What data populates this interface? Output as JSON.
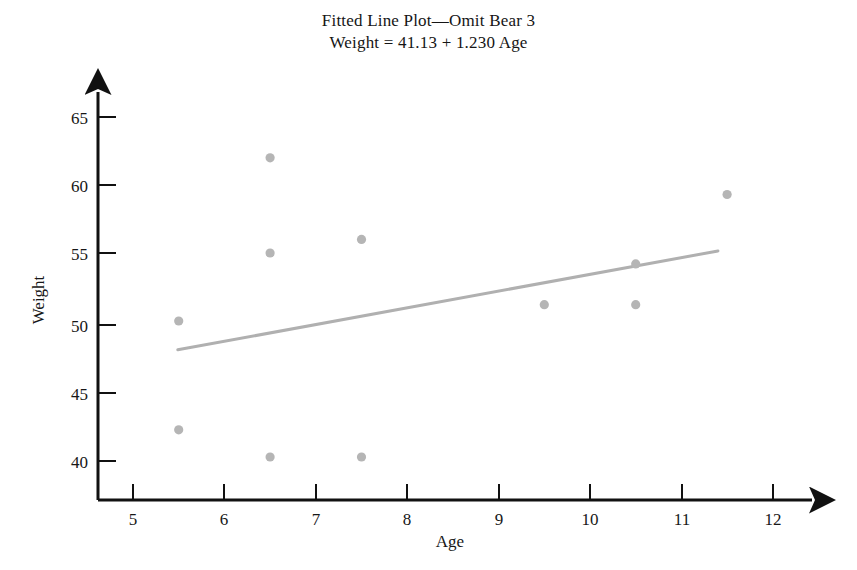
{
  "chart_data": {
    "type": "scatter",
    "title": "Fitted Line Plot—Omit Bear 3",
    "subtitle": "Weight = 41.13 + 1.230 Age",
    "xlabel": "Age",
    "ylabel": "Weight",
    "xlim": [
      4.6,
      12.4
    ],
    "ylim": [
      38.0,
      66.4
    ],
    "xticks": [
      5,
      6,
      7,
      8,
      9,
      10,
      11,
      12
    ],
    "xtick_labels": [
      "5",
      "6",
      "7",
      "8",
      "9",
      "10",
      "11",
      "12"
    ],
    "yticks": [
      40,
      45,
      50,
      55,
      60,
      65
    ],
    "ytick_labels": [
      "40",
      "45",
      "50",
      "55",
      "60",
      "65"
    ],
    "grid": false,
    "legend": "none",
    "point_color": "#b5b5b5",
    "line_color": "#b0b0b0",
    "axis_color": "#111111",
    "x": [
      5.5,
      5.5,
      6.5,
      6.5,
      6.5,
      7.5,
      7.5,
      9.5,
      10.5,
      10.5,
      11.5
    ],
    "y": [
      50.0,
      42.0,
      62.0,
      55.0,
      40.0,
      56.0,
      40.0,
      51.2,
      54.2,
      51.2,
      59.3
    ],
    "points": [
      {
        "age": 5.5,
        "weight": 50.0
      },
      {
        "age": 5.5,
        "weight": 42.0
      },
      {
        "age": 6.5,
        "weight": 62.0
      },
      {
        "age": 6.5,
        "weight": 55.0
      },
      {
        "age": 6.5,
        "weight": 40.0
      },
      {
        "age": 7.5,
        "weight": 56.0
      },
      {
        "age": 7.5,
        "weight": 40.0
      },
      {
        "age": 9.5,
        "weight": 51.2
      },
      {
        "age": 10.5,
        "weight": 54.2
      },
      {
        "age": 10.5,
        "weight": 51.2
      },
      {
        "age": 11.5,
        "weight": 59.3
      }
    ],
    "fit_line": {
      "equation": "Weight = 41.13 + 1.230 Age",
      "intercept": 41.13,
      "slope": 1.23,
      "x_start": 5.49,
      "x_end": 11.4,
      "y_start": 47.88,
      "y_end": 55.15
    }
  }
}
